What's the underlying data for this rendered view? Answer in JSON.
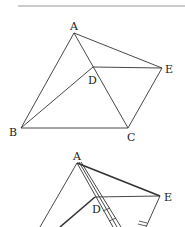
{
  "figure1": {
    "points": {
      "A": {
        "label": "A",
        "x": 74,
        "y": 33
      },
      "B": {
        "label": "B",
        "x": 21,
        "y": 128
      },
      "C": {
        "label": "C",
        "x": 128,
        "y": 128
      },
      "D": {
        "label": "D",
        "x": 93,
        "y": 67
      },
      "E": {
        "label": "E",
        "x": 162,
        "y": 68
      }
    },
    "segments": [
      "AB",
      "AC",
      "AE",
      "BC",
      "BD",
      "DE",
      "CE"
    ]
  },
  "figure2": {
    "points": {
      "A": {
        "label": "A",
        "x": 77,
        "y": 163
      },
      "D": {
        "label": "D",
        "x": 95,
        "y": 197
      },
      "E": {
        "label": "E",
        "x": 160,
        "y": 196
      }
    },
    "segments": [
      "AB",
      "AE",
      "DE",
      "BD",
      "AC",
      "EC"
    ],
    "tick_marks": 3
  },
  "colors": {
    "line": "#333333",
    "text": "#222222",
    "rule": "#999999"
  }
}
